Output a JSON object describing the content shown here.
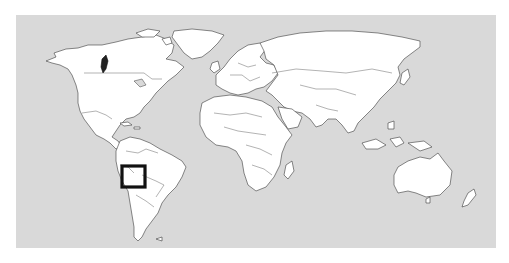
{
  "map": {
    "type": "world-locator-map",
    "projection": "equirectangular-like",
    "colors": {
      "ocean": "#d9d9d9",
      "land": "#ffffff",
      "borders": "#3a3a3a",
      "highlight": "#111111"
    },
    "highlight": {
      "shape": "square-box",
      "region": "Bolivia",
      "continent": "South America"
    },
    "secondary_mark": {
      "region": "Pacific Northwest coast (British Columbia / Washington)",
      "style": "dark filled coastal strip"
    },
    "labels": []
  }
}
